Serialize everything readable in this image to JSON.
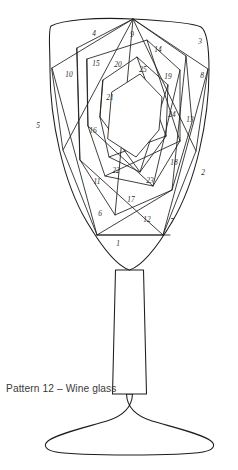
{
  "document": {
    "title": "Pattern 12 – Wine glass",
    "caption": "Pattern 12 – Wine glass",
    "subject": "wine-glass",
    "line_color": "#1d1d1b",
    "background_color": "#ffffff",
    "number_color": "#2b2b29",
    "caption_color": "#3a3a38"
  },
  "diagram": {
    "type": "iris-folding-pattern",
    "segment_count": 25,
    "parts": [
      {
        "name": "bowl",
        "label": "glass bowl"
      },
      {
        "name": "stem",
        "label": "glass stem"
      },
      {
        "name": "foot",
        "label": "glass foot"
      }
    ],
    "segments": [
      {
        "id": 1,
        "label": "1",
        "x": 118,
        "y": 244
      },
      {
        "id": 2,
        "label": "2",
        "x": 203,
        "y": 173
      },
      {
        "id": 3,
        "label": "3",
        "x": 200,
        "y": 42
      },
      {
        "id": 4,
        "label": "4",
        "x": 94,
        "y": 34
      },
      {
        "id": 5,
        "label": "5",
        "x": 38,
        "y": 126
      },
      {
        "id": 6,
        "label": "6",
        "x": 100,
        "y": 214
      },
      {
        "id": 7,
        "label": "7",
        "x": 172,
        "y": 222
      },
      {
        "id": 8,
        "label": "8",
        "x": 202,
        "y": 76
      },
      {
        "id": 9,
        "label": "9",
        "x": 132,
        "y": 35
      },
      {
        "id": 10,
        "label": "10",
        "x": 69,
        "y": 75
      },
      {
        "id": 11,
        "label": "11",
        "x": 97,
        "y": 182
      },
      {
        "id": 12,
        "label": "12",
        "x": 147,
        "y": 220
      },
      {
        "id": 13,
        "label": "13",
        "x": 190,
        "y": 120
      },
      {
        "id": 14,
        "label": "14",
        "x": 158,
        "y": 50
      },
      {
        "id": 15,
        "label": "15",
        "x": 96,
        "y": 64
      },
      {
        "id": 16,
        "label": "16",
        "x": 93,
        "y": 131
      },
      {
        "id": 17,
        "label": "17",
        "x": 131,
        "y": 200
      },
      {
        "id": 18,
        "label": "18",
        "x": 174,
        "y": 163
      },
      {
        "id": 19,
        "label": "19",
        "x": 168,
        "y": 77
      },
      {
        "id": 20,
        "label": "20",
        "x": 118,
        "y": 65
      },
      {
        "id": 21,
        "label": "21",
        "x": 110,
        "y": 98
      },
      {
        "id": 22,
        "label": "22",
        "x": 116,
        "y": 171
      },
      {
        "id": 23,
        "label": "23",
        "x": 150,
        "y": 181
      },
      {
        "id": 24,
        "label": "24",
        "x": 172,
        "y": 115
      },
      {
        "id": 25,
        "label": "25",
        "x": 143,
        "y": 70
      }
    ]
  }
}
